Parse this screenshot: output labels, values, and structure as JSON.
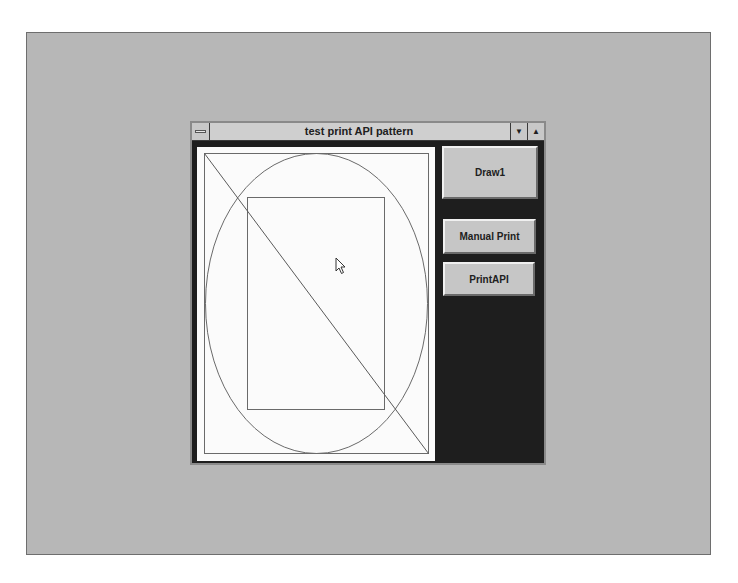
{
  "window": {
    "title": "test print API pattern",
    "system_menu_icon": "system-menu-icon",
    "minimize_icon": "▼",
    "maximize_icon": "▲"
  },
  "buttons": {
    "draw1": "Draw1",
    "manual_print": "Manual Print",
    "print_api": "PrintAPI"
  },
  "canvas": {
    "shapes": [
      "outer-rectangle",
      "ellipse",
      "inner-rectangle",
      "diagonal-line"
    ]
  },
  "colors": {
    "desktop": "#b7b7b7",
    "window_client": "#1e1e1e",
    "titlebar": "#cfcfcf",
    "button_face": "#c6c6c6",
    "canvas": "#fbfbfb",
    "stroke": "#6a6a6a"
  }
}
